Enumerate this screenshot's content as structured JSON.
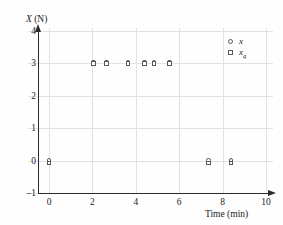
{
  "figure": {
    "background": "#fefefe",
    "axis_color": "#2b2b2b",
    "grid_color": "#e2e2e2",
    "marker_color": "#55595c"
  },
  "axes": {
    "y_label_prefix": "X",
    "y_label_suffix": " (N)",
    "x_label": "Time (min)",
    "y_ticks": [
      "4",
      "3",
      "2",
      "1",
      "0",
      "–1"
    ],
    "x_ticks": [
      "0",
      "2",
      "4",
      "6",
      "8",
      "10"
    ]
  },
  "legend": {
    "items": [
      {
        "marker": "circle-marker",
        "label": "x",
        "subscript": ""
      },
      {
        "marker": "square-marker",
        "label": "x",
        "subscript": "q"
      }
    ]
  },
  "caption": "",
  "chart_data": {
    "type": "scatter",
    "title": "",
    "xlabel": "Time (min)",
    "ylabel": "X (N)",
    "xlim": [
      -1,
      10
    ],
    "ylim": [
      -1,
      4
    ],
    "xticks": [
      0,
      2,
      4,
      6,
      8,
      10
    ],
    "yticks": [
      -1,
      0,
      1,
      2,
      3,
      4
    ],
    "grid": true,
    "legend_position": "upper-right",
    "series": [
      {
        "name": "x",
        "marker": "circle",
        "points": [
          {
            "x": 0.0,
            "y": 0.0
          },
          {
            "x": 2.05,
            "y": 3.05
          },
          {
            "x": 2.65,
            "y": 3.05
          },
          {
            "x": 3.65,
            "y": 3.05
          },
          {
            "x": 4.4,
            "y": 3.05
          },
          {
            "x": 4.85,
            "y": 3.05
          },
          {
            "x": 5.55,
            "y": 3.05
          },
          {
            "x": 7.35,
            "y": 0.0
          },
          {
            "x": 8.4,
            "y": 0.0
          }
        ]
      },
      {
        "name": "x_q",
        "marker": "square",
        "points": [
          {
            "x": 0.0,
            "y": -0.07
          },
          {
            "x": 2.05,
            "y": 3.0
          },
          {
            "x": 2.65,
            "y": 3.0
          },
          {
            "x": 3.65,
            "y": 3.0
          },
          {
            "x": 4.4,
            "y": 3.0
          },
          {
            "x": 4.85,
            "y": 3.0
          },
          {
            "x": 5.55,
            "y": 3.0
          },
          {
            "x": 7.35,
            "y": -0.07
          },
          {
            "x": 8.4,
            "y": -0.07
          }
        ]
      }
    ]
  }
}
